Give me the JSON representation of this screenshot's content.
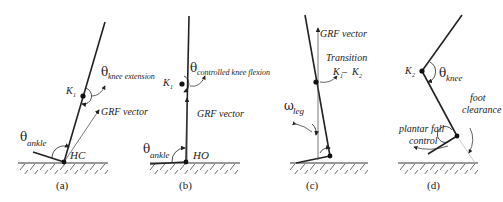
{
  "figure": {
    "panels": [
      {
        "id": "a",
        "caption": "(a)",
        "labels": {
          "theta_knee": "θ",
          "theta_knee_sub": "knee extension",
          "knee": "K",
          "knee_sub": "1",
          "grf": "GRF vector",
          "theta_ankle": "θ",
          "theta_ankle_sub": "ankle",
          "event": "HC"
        }
      },
      {
        "id": "b",
        "caption": "(b)",
        "labels": {
          "theta_knee": "θ",
          "theta_knee_sub": "controlled knee flexion",
          "knee": "K",
          "knee_sub": "1",
          "grf": "GRF vector",
          "theta_ankle": "θ",
          "theta_ankle_sub": "ankle",
          "event": "HO"
        }
      },
      {
        "id": "c",
        "caption": "(c)",
        "labels": {
          "grf": "GRF vector",
          "transition": "Transition",
          "transition_k1": "K",
          "transition_k1_sub": "1",
          "transition_dash": " – ",
          "transition_k2": "K",
          "transition_k2_sub": "2",
          "omega": "ω",
          "omega_sub": "leg"
        }
      },
      {
        "id": "d",
        "caption": "(d)",
        "labels": {
          "knee": "K",
          "knee_sub": "2",
          "theta_knee": "θ",
          "theta_knee_sub": "knee",
          "foot_clearance_1": "foot",
          "foot_clearance_2": "clearance",
          "plantar_1": "plantar fall",
          "plantar_2": "control"
        }
      }
    ]
  }
}
